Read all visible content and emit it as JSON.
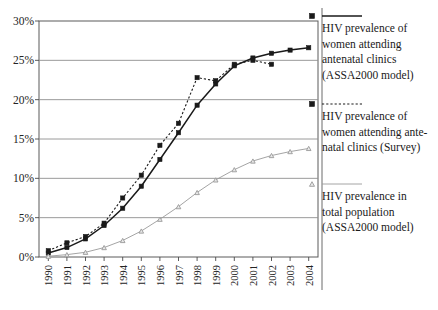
{
  "chart_data": {
    "type": "line",
    "title": "",
    "subtitle": "",
    "xlabel": "",
    "ylabel": "",
    "ylim": [
      0,
      30
    ],
    "ytick_values": [
      0,
      5,
      10,
      15,
      20,
      25,
      30
    ],
    "ytick_labels": [
      "0%",
      "5%",
      "10%",
      "15%",
      "20%",
      "25%",
      "30%"
    ],
    "grid": "horizontal",
    "legend_position": "right",
    "x": [
      1990,
      1991,
      1992,
      1993,
      1994,
      1995,
      1996,
      1997,
      1998,
      1999,
      2000,
      2001,
      2002,
      2003,
      2004
    ],
    "xtick_labels": [
      "1990",
      "1991",
      "1992",
      "1993",
      "1994",
      "1995",
      "1996",
      "1997",
      "1998",
      "1999",
      "2000",
      "2001",
      "2002",
      "2003",
      "2004"
    ],
    "series": [
      {
        "name": "HIV prevalence of women attending antenatal clinics (ASSA2000 model)",
        "legend_label_lines": [
          "HIV prevalence of",
          "women attending",
          "antenatal clinics",
          "(ASSA2000 model)"
        ],
        "marker": "square",
        "linestyle": "solid",
        "color": "#1a1a1a",
        "values": [
          0.5,
          1.2,
          2.3,
          4.0,
          6.2,
          9.0,
          12.4,
          15.8,
          19.3,
          22.0,
          24.3,
          25.3,
          25.9,
          26.3,
          26.6
        ]
      },
      {
        "name": "HIV prevalence of women attending antenatal clinics (Survey)",
        "legend_label_lines": [
          "HIV prevalence of",
          "women attending ante-",
          "natal clinics (Survey)"
        ],
        "marker": "square",
        "linestyle": "dotted",
        "color": "#1a1a1a",
        "values": [
          0.8,
          1.8,
          2.6,
          4.3,
          7.5,
          10.4,
          14.2,
          17.0,
          22.8,
          22.4,
          24.5,
          25.0,
          24.5,
          null,
          null
        ]
      },
      {
        "name": "HIV prevalence in total population (ASSA2000 model)",
        "legend_label_lines": [
          "HIV prevalence in",
          "total population",
          "(ASSA2000 model)"
        ],
        "marker": "triangle",
        "linestyle": "solid",
        "color": "#9a9a9a",
        "values": [
          0.1,
          0.3,
          0.6,
          1.2,
          2.1,
          3.3,
          4.8,
          6.4,
          8.2,
          9.8,
          11.1,
          12.2,
          12.9,
          13.4,
          13.8
        ]
      }
    ]
  },
  "legend": {
    "entries": [
      {
        "marker": "square-solid-line",
        "lines": [
          "HIV prevalence of",
          "women attending",
          "antenatal clinics",
          "(ASSA2000 model)"
        ]
      },
      {
        "marker": "square-dotted-line",
        "lines": [
          "HIV prevalence of",
          "women attending ante-",
          "natal clinics (Survey)"
        ]
      },
      {
        "marker": "triangle-solid-line",
        "lines": [
          "HIV prevalence in",
          "total population",
          "(ASSA2000 model)"
        ]
      }
    ]
  },
  "colors": {
    "axis": "#4a4a4a",
    "grid": "#8f8f8f",
    "series_dark": "#1a1a1a",
    "series_light": "#9a9a9a",
    "background": "#ffffff"
  }
}
